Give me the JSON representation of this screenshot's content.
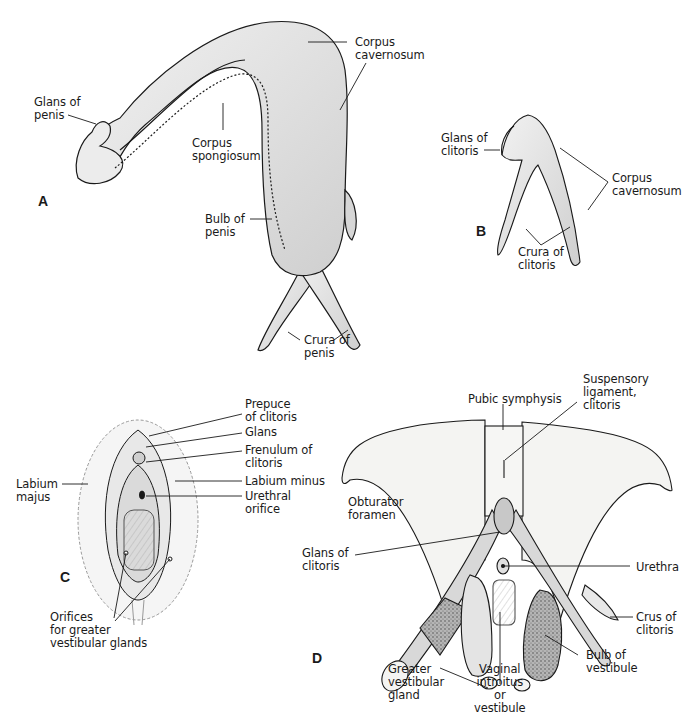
{
  "figure": {
    "panels": [
      {
        "id": "A",
        "letter": "A",
        "labels": {
          "glans_of_penis": "Glans of\npenis",
          "corpus_cavernosum": "Corpus\ncavernosum",
          "corpus_spongiosum": "Corpus\nspongiosum",
          "bulb_of_penis": "Bulb of\npenis",
          "crura_of_penis": "Crura of\npenis"
        }
      },
      {
        "id": "B",
        "letter": "B",
        "labels": {
          "glans_of_clitoris": "Glans of\nclitoris",
          "corpus_cavernosum": "Corpus\ncavernosum",
          "crura_of_clitoris": "Crura of\nclitoris"
        }
      },
      {
        "id": "C",
        "letter": "C",
        "labels": {
          "prepuce_of_clitoris": "Prepuce\nof clitoris",
          "glans": "Glans",
          "frenulum_of_clitoris": "Frenulum of\nclitoris",
          "labium_minus": "Labium minus",
          "urethral_orifice": "Urethral\norifice",
          "labium_majus": "Labium\nmajus",
          "orifices_greater_vestibular_glands": "Orifices\nfor greater\nvestibular glands"
        }
      },
      {
        "id": "D",
        "letter": "D",
        "labels": {
          "pubic_symphysis": "Pubic symphysis",
          "suspensory_ligament_clitoris": "Suspensory\nligament,\nclitoris",
          "obturator_foramen": "Obturator\nforamen",
          "glans_of_clitoris": "Glans of\nclitoris",
          "urethra": "Urethra",
          "crus_of_clitoris": "Crus of\nclitoris",
          "bulb_of_vestibule": "Bulb of\nvestibule",
          "vaginal_introitus_or_vestibule": "Vaginal\nintroitus\nor\nvestibule",
          "greater_vestibular_gland": "Greater\nvestibular\ngland"
        }
      }
    ],
    "colors": {
      "background": "#ffffff",
      "ink": "#1a1a1a",
      "tissue_fill": "#e6e6e6",
      "bone_fill": "#f4f4f2",
      "stipple_fill": "#9a9a9a"
    }
  }
}
